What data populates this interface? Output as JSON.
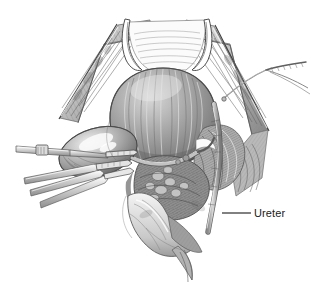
{
  "figure": {
    "kind": "medical-illustration",
    "style": "graphite pencil / pen-and-ink halftone, grayscale",
    "width": 330,
    "height": 290,
    "background_color": "#ffffff",
    "ink_color": "#4a4a4a",
    "label_color": "#1a1a1a",
    "midtone_color": "#9a9a9a",
    "shadow_color": "#5c5c5c",
    "highlight_color": "#f2f2f2"
  },
  "callouts": [
    {
      "id": "ureter",
      "label": "Ureter",
      "label_x": 254,
      "label_y": 207,
      "leader_x1": 222,
      "leader_y1": 213,
      "leader_x2": 251,
      "leader_y2": 213
    }
  ],
  "structures": [
    {
      "id": "uterus",
      "name": "Uterine corpus",
      "cx": 163,
      "cy": 118
    },
    {
      "id": "left-adnexa",
      "name": "Left adnexa / ovary",
      "cx": 98,
      "cy": 152
    },
    {
      "id": "right-pedicle",
      "name": "Right uterine pedicle",
      "cx": 218,
      "cy": 148
    },
    {
      "id": "cervix-vaginal-cuff",
      "name": "Cervix and vaginal cuff",
      "cx": 175,
      "cy": 232
    },
    {
      "id": "parametrial-tissue",
      "name": "Parametrial tissue",
      "cx": 180,
      "cy": 190
    },
    {
      "id": "abdominal-wall-left",
      "name": "Retracted abdominal wall, left",
      "cx": 86,
      "cy": 72
    },
    {
      "id": "abdominal-wall-right",
      "name": "Retracted abdominal wall, right",
      "cx": 238,
      "cy": 80
    },
    {
      "id": "bladder-flap",
      "name": "Bladder flap",
      "cx": 170,
      "cy": 52
    }
  ],
  "instruments": [
    {
      "id": "clamp-upper-left",
      "name": "Surgical clamp, upper left"
    },
    {
      "id": "clamp-lower-left",
      "name": "Surgical clamp, lower left"
    },
    {
      "id": "suture-needle",
      "name": "Suture with curved needle, upper right"
    }
  ]
}
